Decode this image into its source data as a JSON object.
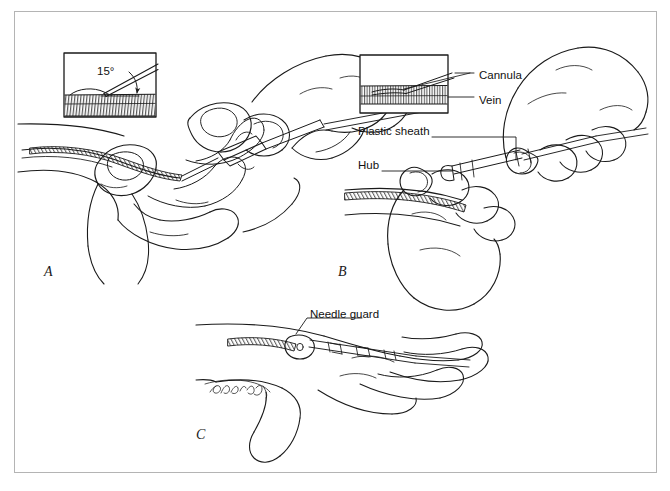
{
  "figure": {
    "type": "medical-illustration",
    "background_color": "#ffffff",
    "border_color": "#b4b4b4",
    "ink_color": "#1a1a1a"
  },
  "panels": [
    {
      "id": "A",
      "letter": "A",
      "caption_position": {
        "x": 44,
        "y": 272
      },
      "description": "Operator stretches skin taut over dorsum of hand and inserts the cannula at a shallow angle"
    },
    {
      "id": "B",
      "letter": "B",
      "caption_position": {
        "x": 338,
        "y": 272
      },
      "description": "Plastic sheath advanced off the needle into the vein while the hub is held"
    },
    {
      "id": "C",
      "letter": "C",
      "caption_position": {
        "x": 196,
        "y": 434
      },
      "description": "Needle withdrawn into the needle guard leaving the catheter in the vein"
    }
  ],
  "insets": [
    {
      "panel": "A",
      "name": "angle-inset",
      "angle_label": "15°",
      "angle_value": 15,
      "angle_unit": "degrees",
      "box": {
        "x": 64,
        "y": 53,
        "width": 92,
        "height": 64
      },
      "contents": "Cross-section of skin with needle entering at 15 degrees"
    },
    {
      "panel": "B",
      "name": "vein-inset",
      "box": {
        "x": 360,
        "y": 55,
        "width": 88,
        "height": 58
      },
      "contents": "Cross-section showing cannula tip seated inside the vein lumen"
    }
  ],
  "labels": [
    {
      "id": "cannula",
      "text": "Cannula",
      "x": 479,
      "y": 76,
      "leader": "horizontal line left to inset"
    },
    {
      "id": "vein",
      "text": "Vein",
      "x": 479,
      "y": 101,
      "leader": "horizontal line left to inset"
    },
    {
      "id": "plastic-sheath",
      "text": "Plastic sheath",
      "x": 358,
      "y": 132,
      "leader": "horizontal then down to catheter sheath"
    },
    {
      "id": "hub",
      "text": "Hub",
      "x": 358,
      "y": 166,
      "leader": "horizontal line right to hub of device"
    },
    {
      "id": "needle-guard",
      "text": "Needle guard",
      "x": 310,
      "y": 315,
      "leader": "angled line down-left to guard body"
    }
  ],
  "signature": {
    "present": true,
    "style": "cursive artist signature",
    "x": 210,
    "y": 388
  }
}
